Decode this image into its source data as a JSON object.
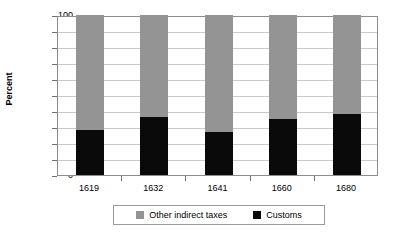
{
  "chart_data": {
    "type": "bar",
    "stacked": true,
    "title": "",
    "xlabel": "",
    "ylabel": "Percent",
    "categories": [
      "1619",
      "1632",
      "1641",
      "1660",
      "1680"
    ],
    "series": [
      {
        "name": "Customs",
        "color": "#0a0a0a",
        "values": [
          28,
          36,
          27,
          35,
          38
        ]
      },
      {
        "name": "Other indirect taxes",
        "color": "#949494",
        "values": [
          72,
          64,
          73,
          65,
          62
        ]
      }
    ],
    "ylim": [
      0,
      100
    ],
    "ytick_labels": [
      "100",
      "90",
      "80",
      "70",
      "60",
      "50",
      "40",
      "30",
      "20",
      "10",
      "0"
    ],
    "ytick_values": [
      100,
      90,
      80,
      70,
      60,
      50,
      40,
      30,
      20,
      10,
      0
    ],
    "grid": true,
    "legend_position": "bottom",
    "legend_order": [
      "Other indirect taxes",
      "Customs"
    ]
  },
  "axis": {
    "y_title": "Percent"
  },
  "legend": {
    "items": [
      {
        "label": "Other indirect taxes",
        "swatch": "gray-swatch-icon"
      },
      {
        "label": "Customs",
        "swatch": "black-swatch-icon"
      }
    ]
  },
  "colors": {
    "other_indirect_taxes": "#949494",
    "customs": "#0a0a0a",
    "gridline": "#c9c9c9",
    "axis": "#8d8d8d",
    "background": "#ffffff"
  }
}
